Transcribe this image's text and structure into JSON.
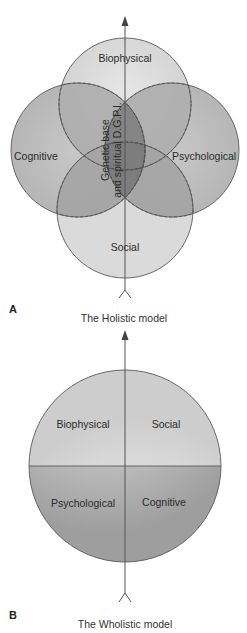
{
  "panel_a": {
    "letter": "A",
    "title": "The Holistic model",
    "circles": {
      "top": "Biophysical",
      "left": "Cognitive",
      "right": "Psychological",
      "bottom": "Social"
    },
    "center_label_line1": "Genetic base",
    "center_label_line2": "and spiritual D.G.P.I."
  },
  "panel_b": {
    "letter": "B",
    "title": "The Wholistic model",
    "quadrants": {
      "top_left": "Biophysical",
      "top_right": "Social",
      "bottom_left": "Psychological",
      "bottom_right": "Cognitive"
    }
  },
  "colors": {
    "outline": "#5a5a5a",
    "light_fill": "#d6d6d6",
    "mid_fill": "#b9b9b9",
    "dark_fill": "#8f8f8f",
    "arrow": "#555555"
  }
}
